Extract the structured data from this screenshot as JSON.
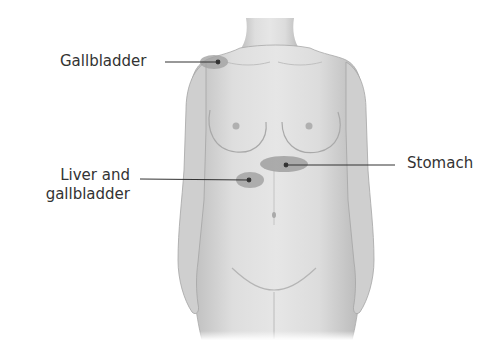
{
  "diagram": {
    "labels": [
      {
        "id": "gallbladder-shoulder",
        "text": "Gallbladder",
        "target": "right shoulder"
      },
      {
        "id": "liver-gallbladder",
        "line1": "Liver and",
        "line2": "gallbladder",
        "target": "right upper abdomen"
      },
      {
        "id": "stomach",
        "text": "Stomach",
        "target": "left upper abdomen"
      }
    ],
    "colors": {
      "skin": "#d9d9d9",
      "skin_shadow": "#b3b3b3",
      "highlight_region": "#9e9e9e",
      "leader_line": "#333333",
      "text": "#333333"
    }
  }
}
